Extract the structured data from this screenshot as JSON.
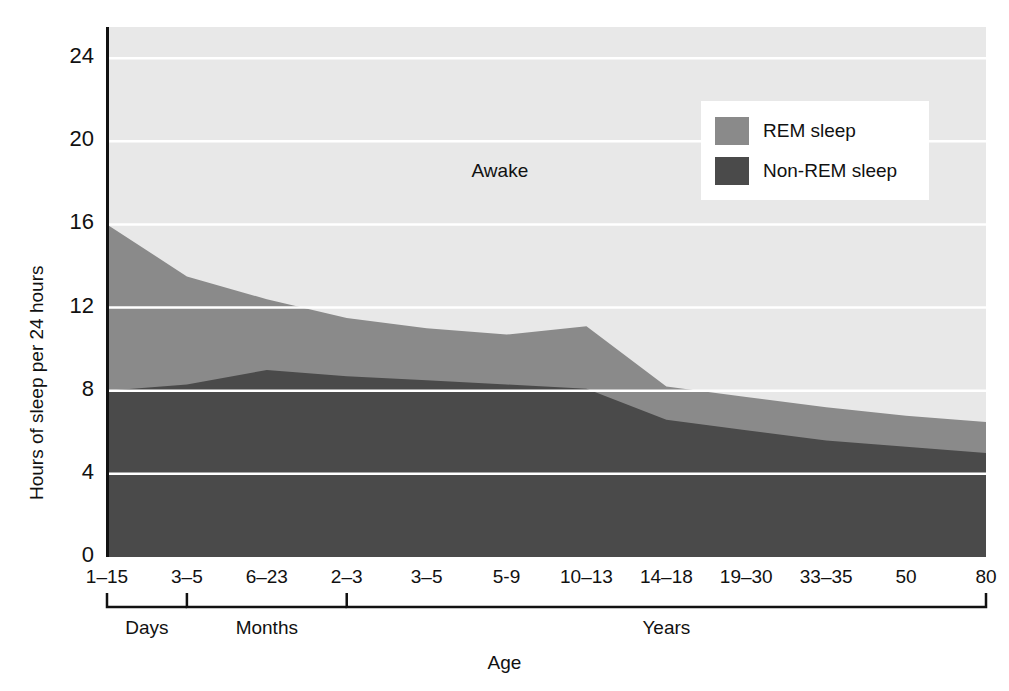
{
  "chart_data": {
    "type": "area",
    "title": "",
    "xlabel": "Age",
    "ylabel": "Hours of sleep per 24 hours",
    "ylim": [
      0,
      25.5
    ],
    "yticks": [
      0,
      4,
      8,
      12,
      16,
      20,
      24
    ],
    "grid": "horizontal-white",
    "legend_position": "top-right",
    "stacked": true,
    "categories": [
      "1–15",
      "3–5",
      "6–23",
      "2–3",
      "3–5",
      "5-9",
      "10–13",
      "14–18",
      "19–30",
      "33–35",
      "50",
      "80"
    ],
    "category_groups": [
      {
        "label": "Days",
        "from_index": 0,
        "to_index": 1
      },
      {
        "label": "Months",
        "from_index": 1,
        "to_index": 3
      },
      {
        "label": "Years",
        "from_index": 3,
        "to_index": 11
      }
    ],
    "series": [
      {
        "name": "Non-REM sleep",
        "color": "#4a4a4a",
        "values": [
          8.0,
          8.3,
          9.0,
          8.7,
          8.5,
          8.3,
          8.1,
          6.6,
          6.1,
          5.6,
          5.3,
          5.0
        ]
      },
      {
        "name": "REM sleep",
        "color": "#8a8a8a",
        "values": [
          8.0,
          5.2,
          3.4,
          2.8,
          2.5,
          2.4,
          3.0,
          1.6,
          1.6,
          1.6,
          1.5,
          1.5
        ]
      },
      {
        "name": "Awake",
        "color": "#e8e8e8",
        "values": [
          9.5,
          11.9,
          13.1,
          13.9,
          14.5,
          14.8,
          14.4,
          17.3,
          17.8,
          18.3,
          18.7,
          19.0
        ]
      }
    ],
    "total_sleep_hours": [
      16.0,
      13.5,
      12.4,
      11.5,
      11.0,
      10.7,
      11.1,
      8.2,
      7.7,
      7.2,
      6.8,
      6.5
    ],
    "annotations": [
      {
        "text": "Awake",
        "x_category": "5-9",
        "y_hours": 18.5
      }
    ],
    "legend": [
      {
        "label": "REM sleep",
        "color": "#8a8a8a"
      },
      {
        "label": "Non-REM sleep",
        "color": "#4a4a4a"
      }
    ]
  },
  "axes": {
    "y_title": "Hours of sleep per 24 hours",
    "x_title": "Age",
    "y_tick_labels": [
      "24",
      "20",
      "16",
      "12",
      "8",
      "4",
      "0"
    ],
    "x_tick_labels": [
      "1–15",
      "3–5",
      "6–23",
      "2–3",
      "3–5",
      "5-9",
      "10–13",
      "14–18",
      "19–30",
      "33–35",
      "50",
      "80"
    ],
    "group_labels": [
      "Days",
      "Months",
      "Years"
    ]
  },
  "labels": {
    "awake": "Awake"
  },
  "colors": {
    "awake": "#e8e8e8",
    "rem": "#8a8a8a",
    "nonrem": "#4a4a4a",
    "axis": "#111111",
    "gridline": "#ffffff",
    "background": "#ffffff"
  }
}
